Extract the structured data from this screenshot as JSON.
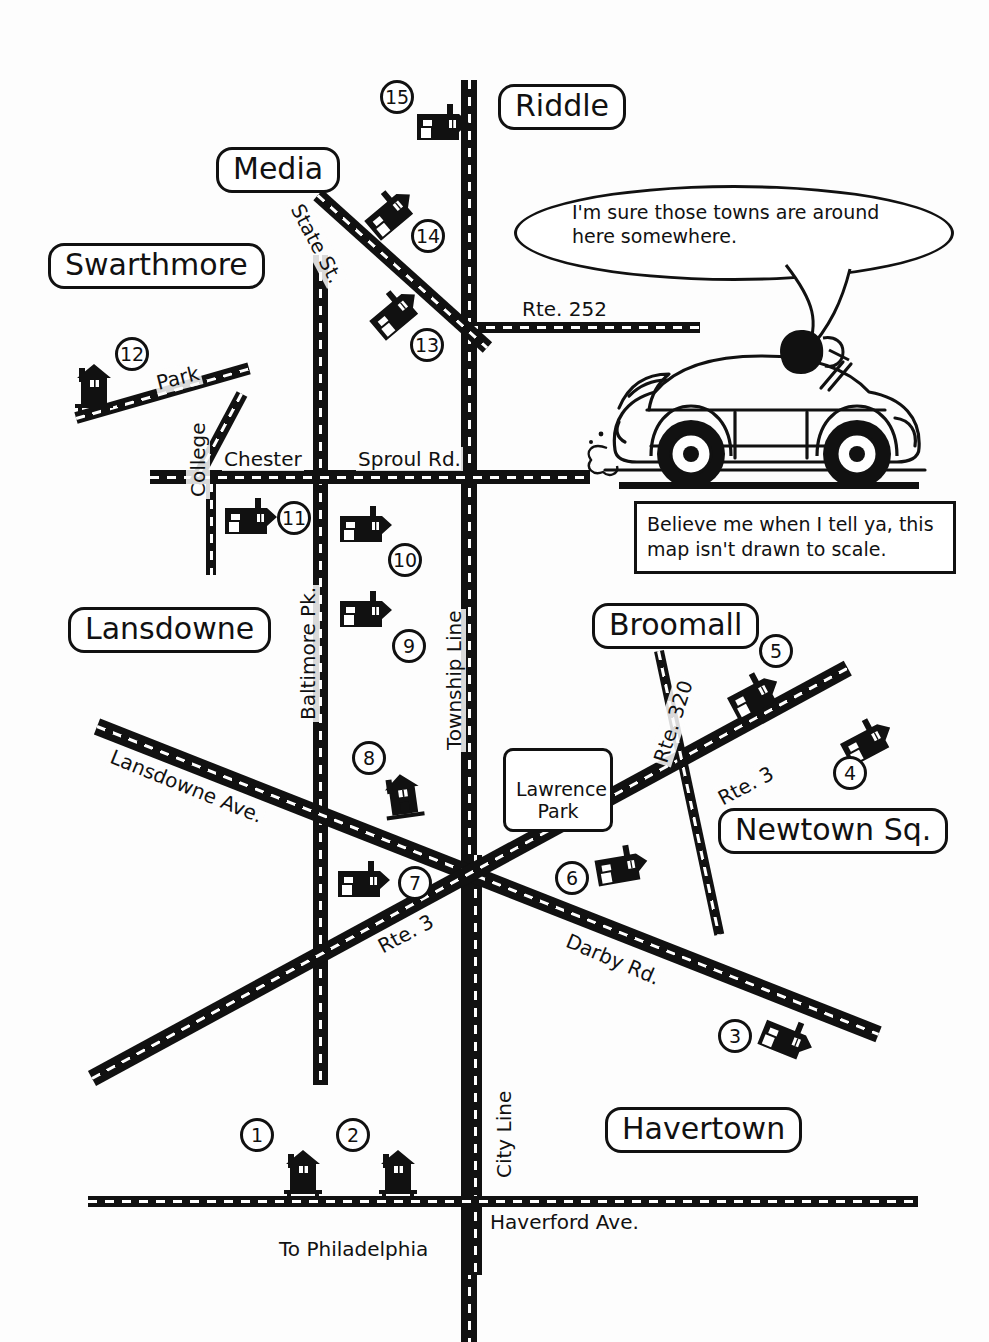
{
  "map": {
    "title": "Hand-drawn area road map",
    "footer_text": "",
    "towns": [
      {
        "name": "Riddle",
        "label": "Riddle"
      },
      {
        "name": "Media",
        "label": "Media"
      },
      {
        "name": "Swarthmore",
        "label": "Swarthmore"
      },
      {
        "name": "Lansdowne",
        "label": "Lansdowne"
      },
      {
        "name": "Broomall",
        "label": "Broomall"
      },
      {
        "name": "Newtown Sq.",
        "label": "Newtown Sq."
      },
      {
        "name": "Havertown",
        "label": "Havertown"
      }
    ],
    "park_box": {
      "label": "Lawrence\nPark"
    },
    "streets": [
      {
        "id": "state-st",
        "label": "State St."
      },
      {
        "id": "rte-252",
        "label": "Rte. 252"
      },
      {
        "id": "park",
        "label": "Park"
      },
      {
        "id": "chester",
        "label": "Chester"
      },
      {
        "id": "sproul-rd",
        "label": "Sproul Rd."
      },
      {
        "id": "college",
        "label": "College"
      },
      {
        "id": "baltimore-pk",
        "label": "Baltimore Pk."
      },
      {
        "id": "township-line",
        "label": "Township Line"
      },
      {
        "id": "lansdowne-ave",
        "label": "Lansdowne Ave."
      },
      {
        "id": "rte-320",
        "label": "Rte. 320"
      },
      {
        "id": "rte-3-east",
        "label": "Rte. 3"
      },
      {
        "id": "rte-3-west",
        "label": "Rte. 3"
      },
      {
        "id": "darby-rd",
        "label": "Darby Rd."
      },
      {
        "id": "city-line",
        "label": "City Line"
      },
      {
        "id": "haverford-ave",
        "label": "Haverford Ave."
      },
      {
        "id": "to-philadelphia",
        "label": "To Philadelphia"
      }
    ],
    "markers": [
      {
        "number": "1"
      },
      {
        "number": "2"
      },
      {
        "number": "3"
      },
      {
        "number": "4"
      },
      {
        "number": "5"
      },
      {
        "number": "6"
      },
      {
        "number": "7"
      },
      {
        "number": "8"
      },
      {
        "number": "9"
      },
      {
        "number": "10"
      },
      {
        "number": "11"
      },
      {
        "number": "12"
      },
      {
        "number": "13"
      },
      {
        "number": "14"
      },
      {
        "number": "15"
      }
    ],
    "speech_bubble": {
      "text": "I'm sure those towns are around here somewhere."
    },
    "caption": {
      "text": "Believe me when I tell ya, this map isn't drawn to scale."
    },
    "colors": {
      "ink": "#111111",
      "paper": "#fdfdfd",
      "road_dash": "#ffffff"
    }
  }
}
